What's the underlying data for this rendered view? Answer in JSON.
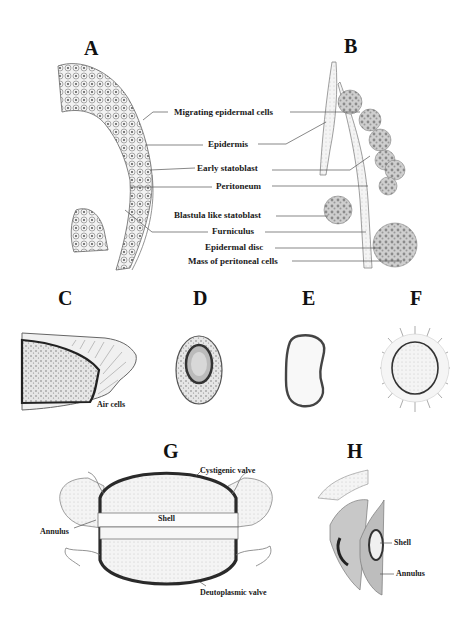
{
  "figure": {
    "panels": {
      "A": {
        "letter": "A"
      },
      "B": {
        "letter": "B"
      },
      "C": {
        "letter": "C",
        "labels": [
          "Air cells"
        ]
      },
      "D": {
        "letter": "D"
      },
      "E": {
        "letter": "E"
      },
      "F": {
        "letter": "F"
      },
      "G": {
        "letter": "G",
        "labels": [
          "Cystigenic valve",
          "Shell",
          "Annulus",
          "Deutoplasmic valve"
        ]
      },
      "H": {
        "letter": "H",
        "labels": [
          "Shell",
          "Annulus"
        ]
      }
    },
    "ab_labels": [
      "Migrating epidermal cells",
      "Epidermis",
      "Early statoblast",
      "Peritoneum",
      "Blastula like statoblast",
      "Furniculus",
      "Epidermal disc",
      "Mass of peritoneal cells"
    ]
  },
  "colors": {
    "ink": "#1a1a1a",
    "line": "#555555",
    "tissue": "#d9d9d9",
    "dark_wall": "#333333"
  }
}
